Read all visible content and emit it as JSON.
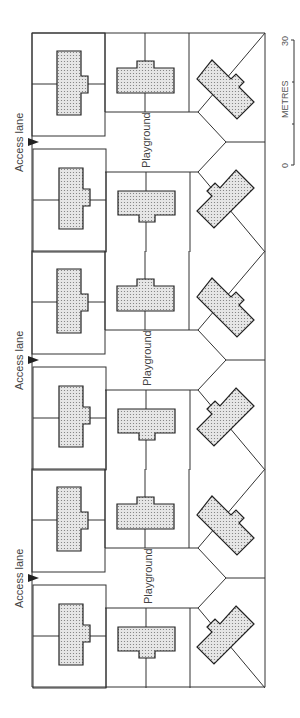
{
  "diagram": {
    "type": "site-plan",
    "orientation": "rotated-90",
    "labels": {
      "access_lane": "Access lane",
      "playground": "Playground"
    },
    "clusters": [
      {
        "access_lane_label": "Access lane",
        "playground_label": "Playground",
        "center_y": 142
      },
      {
        "access_lane_label": "Access lane",
        "playground_label": "Playground",
        "center_y": 360
      },
      {
        "access_lane_label": "Access lane",
        "playground_label": "Playground",
        "center_y": 578
      }
    ],
    "scale_bar": {
      "unit_label": "METRES",
      "start_label": "0",
      "end_label": "30"
    },
    "colors": {
      "line": "#333333",
      "building_fill": "#d8d8d8",
      "background": "#ffffff"
    }
  }
}
